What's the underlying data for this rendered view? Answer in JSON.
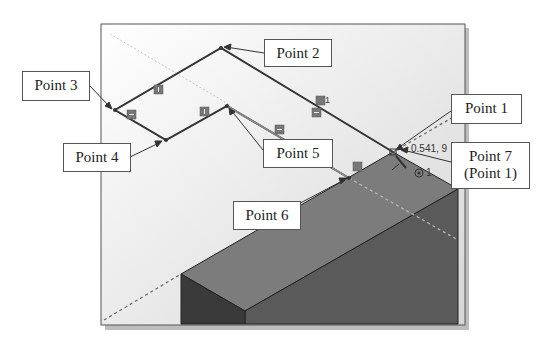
{
  "figure": {
    "callouts": {
      "point1": "Point 1",
      "point2": "Point 2",
      "point3": "Point 3",
      "point4": "Point 4",
      "point5": "Point 5",
      "point6": "Point 6",
      "point7_line1": "Point 7",
      "point7_line2": "(Point 1)"
    },
    "cursor_coordinates": "0.541, 9",
    "relation_glyphs": [
      "vertical",
      "horizontal",
      "vertical",
      "horizontal",
      "coincident",
      "tangent",
      "concentric"
    ],
    "constraint_label": "1",
    "colors": {
      "viewport_bg_top": "#ffffff",
      "viewport_bg_bottom": "#dcdcdc",
      "sketch_line": "#333333",
      "box_top": "#7a7a7a",
      "box_front": "#5e5e5e",
      "box_side": "#3c3c3c",
      "frame_shadow": "#bdbdbd"
    }
  }
}
